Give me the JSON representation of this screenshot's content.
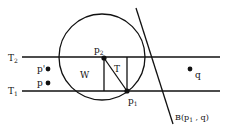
{
  "diagram": {
    "lines": {
      "t2": {
        "label": "T",
        "sub": "2"
      },
      "t1": {
        "label": "T",
        "sub": "1"
      }
    },
    "points": {
      "p_prime": {
        "label": "p'"
      },
      "p": {
        "label": "p"
      },
      "q": {
        "label": "q"
      },
      "p2": {
        "label": "p",
        "sub": "2"
      },
      "p1": {
        "label": "p",
        "sub": "1"
      }
    },
    "regions": {
      "w": "W",
      "t": "T"
    },
    "bisector": {
      "label_pre": "B(p",
      "sub": "1",
      "label_post": " , q)"
    }
  }
}
